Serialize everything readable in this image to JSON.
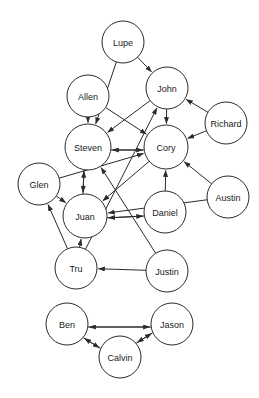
{
  "diagram": {
    "type": "directed-graph",
    "title": "",
    "background_color": "#ffffff",
    "node_fill_color": "#ffffff",
    "node_stroke_color": "#2b2b2b",
    "edge_color": "#2b2b2b",
    "node_radius": 21,
    "components": 2,
    "nodes": [
      {
        "id": "lupe",
        "label": "Lupe",
        "x": 123,
        "y": 42,
        "r": 21,
        "component": 1
      },
      {
        "id": "allen",
        "label": "Allen",
        "x": 88,
        "y": 96,
        "r": 21,
        "component": 1
      },
      {
        "id": "john",
        "label": "John",
        "x": 167,
        "y": 88,
        "r": 21,
        "component": 1
      },
      {
        "id": "richard",
        "label": "Richard",
        "x": 226,
        "y": 123,
        "r": 21,
        "component": 1
      },
      {
        "id": "steven",
        "label": "Steven",
        "x": 88,
        "y": 147,
        "r": 23,
        "component": 1
      },
      {
        "id": "cory",
        "label": "Cory",
        "x": 166,
        "y": 147,
        "r": 22,
        "component": 1
      },
      {
        "id": "glen",
        "label": "Glen",
        "x": 39,
        "y": 184,
        "r": 21,
        "component": 1
      },
      {
        "id": "austin",
        "label": "Austin",
        "x": 228,
        "y": 197,
        "r": 21,
        "component": 1
      },
      {
        "id": "juan",
        "label": "Juan",
        "x": 85,
        "y": 216,
        "r": 22,
        "component": 1
      },
      {
        "id": "daniel",
        "label": "Daniel",
        "x": 165,
        "y": 212,
        "r": 21,
        "component": 1
      },
      {
        "id": "tru",
        "label": "Tru",
        "x": 76,
        "y": 268,
        "r": 21,
        "component": 1
      },
      {
        "id": "justin",
        "label": "Justin",
        "x": 167,
        "y": 271,
        "r": 21,
        "component": 1
      },
      {
        "id": "ben",
        "label": "Ben",
        "x": 67,
        "y": 324,
        "r": 21,
        "component": 2
      },
      {
        "id": "jason",
        "label": "Jason",
        "x": 172,
        "y": 324,
        "r": 21,
        "component": 2
      },
      {
        "id": "calvin",
        "label": "Calvin",
        "x": 120,
        "y": 357,
        "r": 21,
        "component": 2
      }
    ],
    "edges": [
      {
        "from": "lupe",
        "to": "john",
        "directed": true,
        "offset": 0
      },
      {
        "from": "lupe",
        "to": "steven",
        "directed": true,
        "offset": 0
      },
      {
        "from": "allen",
        "to": "steven",
        "directed": true,
        "offset": 0
      },
      {
        "from": "allen",
        "to": "cory",
        "directed": true,
        "offset": 0
      },
      {
        "from": "john",
        "to": "cory",
        "directed": true,
        "offset": 0
      },
      {
        "from": "john",
        "to": "steven",
        "directed": true,
        "offset": 0
      },
      {
        "from": "richard",
        "to": "john",
        "directed": true,
        "offset": 0
      },
      {
        "from": "richard",
        "to": "cory",
        "directed": true,
        "offset": 0
      },
      {
        "from": "steven",
        "to": "cory",
        "directed": true,
        "offset": 3
      },
      {
        "from": "cory",
        "to": "steven",
        "directed": true,
        "offset": -3
      },
      {
        "from": "cory",
        "to": "juan",
        "directed": true,
        "offset": 0
      },
      {
        "from": "glen",
        "to": "juan",
        "directed": true,
        "offset": 0
      },
      {
        "from": "glen",
        "to": "cory",
        "directed": true,
        "offset": 0
      },
      {
        "from": "steven",
        "to": "juan",
        "directed": true,
        "offset": 3
      },
      {
        "from": "juan",
        "to": "steven",
        "directed": true,
        "offset": -3
      },
      {
        "from": "juan",
        "to": "daniel",
        "directed": true,
        "offset": 3
      },
      {
        "from": "daniel",
        "to": "juan",
        "directed": true,
        "offset": -3
      },
      {
        "from": "daniel",
        "to": "cory",
        "directed": true,
        "offset": 0
      },
      {
        "from": "austin",
        "to": "cory",
        "directed": true,
        "offset": 0
      },
      {
        "from": "austin",
        "to": "juan",
        "directed": true,
        "offset": 0
      },
      {
        "from": "tru",
        "to": "glen",
        "directed": true,
        "offset": 0
      },
      {
        "from": "tru",
        "to": "juan",
        "directed": true,
        "offset": 0
      },
      {
        "from": "tru",
        "to": "john",
        "directed": true,
        "offset": 0
      },
      {
        "from": "justin",
        "to": "tru",
        "directed": true,
        "offset": 0
      },
      {
        "from": "justin",
        "to": "steven",
        "directed": true,
        "offset": 0
      },
      {
        "from": "ben",
        "to": "jason",
        "directed": true,
        "offset": 3
      },
      {
        "from": "jason",
        "to": "ben",
        "directed": true,
        "offset": -3
      },
      {
        "from": "ben",
        "to": "calvin",
        "directed": true,
        "offset": 3
      },
      {
        "from": "calvin",
        "to": "ben",
        "directed": true,
        "offset": -3
      },
      {
        "from": "jason",
        "to": "calvin",
        "directed": true,
        "offset": 3
      },
      {
        "from": "calvin",
        "to": "jason",
        "directed": true,
        "offset": -3
      }
    ]
  }
}
